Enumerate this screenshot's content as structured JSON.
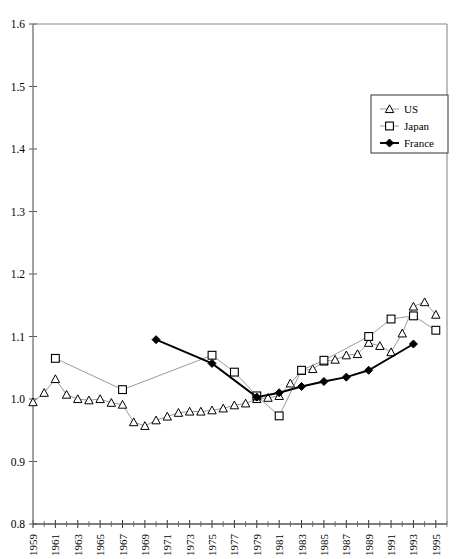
{
  "chart_data": {
    "type": "line",
    "title": "",
    "subtitle": "",
    "xlabel": "",
    "ylabel": "",
    "xlim": [
      1959,
      1996
    ],
    "ylim": [
      0.8,
      1.6
    ],
    "grid": false,
    "legend_position": "top-right",
    "y_ticks": [
      "0.8",
      "0.9",
      "1.0",
      "1.1",
      "1.2",
      "1.3",
      "1.4",
      "1.5",
      "1.6"
    ],
    "y_tick_values": [
      0.8,
      0.9,
      1.0,
      1.1,
      1.2,
      1.3,
      1.4,
      1.5,
      1.6
    ],
    "x_tick_labels": [
      "1959",
      "1961",
      "1963",
      "1965",
      "1967",
      "1969",
      "1971",
      "1973",
      "1975",
      "1977",
      "1979",
      "1981",
      "1983",
      "1985",
      "1987",
      "1989",
      "1991",
      "1993",
      "1995"
    ],
    "x_tick_values": [
      1959,
      1961,
      1963,
      1965,
      1967,
      1969,
      1971,
      1973,
      1975,
      1977,
      1979,
      1981,
      1983,
      1985,
      1987,
      1989,
      1991,
      1993,
      1995
    ],
    "x_minor_values": [
      1960,
      1962,
      1964,
      1966,
      1968,
      1970,
      1972,
      1974,
      1976,
      1978,
      1980,
      1982,
      1984,
      1986,
      1988,
      1990,
      1992,
      1994,
      1996
    ],
    "series": [
      {
        "name": "US",
        "marker": "triangle-open",
        "color": "#808080",
        "line_width": 0.8,
        "x": [
          1959,
          1960,
          1961,
          1962,
          1963,
          1964,
          1965,
          1966,
          1967,
          1968,
          1969,
          1970,
          1971,
          1972,
          1973,
          1974,
          1975,
          1976,
          1977,
          1978,
          1979,
          1980,
          1981,
          1982,
          1983,
          1984,
          1985,
          1986,
          1987,
          1988,
          1989,
          1990,
          1991,
          1992,
          1993,
          1994,
          1995
        ],
        "values": [
          0.995,
          1.01,
          1.032,
          1.007,
          1.0,
          0.998,
          1.0,
          0.994,
          0.991,
          0.963,
          0.957,
          0.966,
          0.972,
          0.978,
          0.98,
          0.98,
          0.982,
          0.985,
          0.99,
          0.993,
          1.0,
          1.002,
          1.005,
          1.025,
          1.045,
          1.048,
          1.06,
          1.063,
          1.07,
          1.072,
          1.09,
          1.085,
          1.075,
          1.105,
          1.148,
          1.155,
          1.135
        ]
      },
      {
        "name": "Japan",
        "marker": "square-open",
        "color": "#808080",
        "line_width": 0.8,
        "x": [
          1961,
          1967,
          1975,
          1977,
          1979,
          1981,
          1983,
          1985,
          1989,
          1991,
          1993,
          1995
        ],
        "values": [
          1.065,
          1.015,
          1.07,
          1.043,
          1.005,
          0.973,
          1.046,
          1.062,
          1.1,
          1.128,
          1.133,
          1.11
        ]
      },
      {
        "name": "France",
        "marker": "diamond-filled",
        "color": "#000000",
        "line_width": 1.9,
        "x": [
          1970,
          1975,
          1979,
          1981,
          1983,
          1985,
          1987,
          1989,
          1993
        ],
        "values": [
          1.095,
          1.057,
          1.003,
          1.01,
          1.02,
          1.028,
          1.035,
          1.046,
          1.088
        ]
      }
    ]
  },
  "legend": {
    "entries": [
      {
        "label": "US"
      },
      {
        "label": "Japan"
      },
      {
        "label": "France"
      }
    ]
  }
}
